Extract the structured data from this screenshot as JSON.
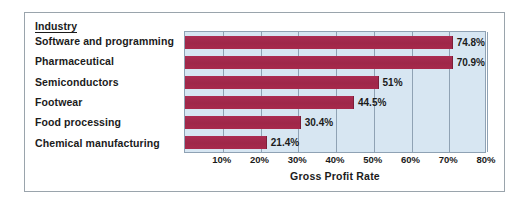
{
  "chart_data": {
    "type": "bar",
    "orientation": "horizontal",
    "title": "",
    "category_header": "Industry",
    "xlabel": "Gross Profit Rate",
    "ylabel": "",
    "categories": [
      "Software and programming",
      "Pharmaceutical",
      "Semiconductors",
      "Footwear",
      "Food processing",
      "Chemical manufacturing"
    ],
    "values": [
      74.8,
      70.9,
      51,
      44.5,
      30.4,
      21.4
    ],
    "value_labels": [
      "74.8%",
      "70.9%",
      "51%",
      "44.5%",
      "30.4%",
      "21.4%"
    ],
    "xlim": [
      0,
      80
    ],
    "xticks": [
      10,
      20,
      30,
      40,
      50,
      60,
      70,
      80
    ],
    "xtick_labels": [
      "10%",
      "20%",
      "30%",
      "40%",
      "50%",
      "60%",
      "70%",
      "80%"
    ],
    "grid": true,
    "legend": null,
    "colors": {
      "bar": "#a8294c",
      "plot_background": "#d7e6f2",
      "gridline": "#8fa2b4",
      "text": "#1b1b1b",
      "figure_border": "#9aa4ac"
    }
  }
}
